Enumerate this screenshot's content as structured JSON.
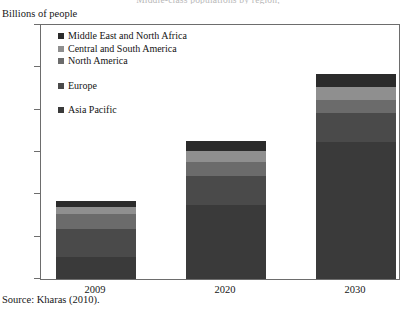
{
  "clipped_title": "Middle-class populations by region,",
  "axis_title": "Billions of people",
  "source": "Source: Kharas (2010).",
  "legend": {
    "items": [
      {
        "label": "Middle East and North Africa",
        "color": "#2b2b2b"
      },
      {
        "label": "Central and South America",
        "color": "#8f8f8f"
      },
      {
        "label": "North America",
        "color": "#6b6b6b"
      },
      {
        "label": "Europe",
        "color": "#4a4a4a"
      },
      {
        "label": "Asia Pacific",
        "color": "#3a3a3a"
      }
    ]
  },
  "chart_data": {
    "type": "bar",
    "stacked": true,
    "title": "Middle-class populations by region,",
    "xlabel": "",
    "ylabel": "Billions of people",
    "ylim": [
      0,
      6
    ],
    "yticks": [
      0,
      1,
      2,
      3,
      4,
      5,
      6
    ],
    "grid": false,
    "legend_position": "inside-top-left",
    "categories": [
      "2009",
      "2020",
      "2030"
    ],
    "series": [
      {
        "name": "Asia Pacific",
        "color": "#3a3a3a",
        "values": [
          0.53,
          1.74,
          3.23
        ]
      },
      {
        "name": "Europe",
        "color": "#4a4a4a",
        "values": [
          0.66,
          0.7,
          0.68
        ]
      },
      {
        "name": "North America",
        "color": "#6b6b6b",
        "values": [
          0.34,
          0.33,
          0.32
        ]
      },
      {
        "name": "Central and South America",
        "color": "#8f8f8f",
        "values": [
          0.18,
          0.25,
          0.31
        ]
      },
      {
        "name": "Middle East and North Africa",
        "color": "#2b2b2b",
        "values": [
          0.14,
          0.23,
          0.31
        ]
      }
    ],
    "totals": [
      1.85,
      3.25,
      4.85
    ]
  }
}
